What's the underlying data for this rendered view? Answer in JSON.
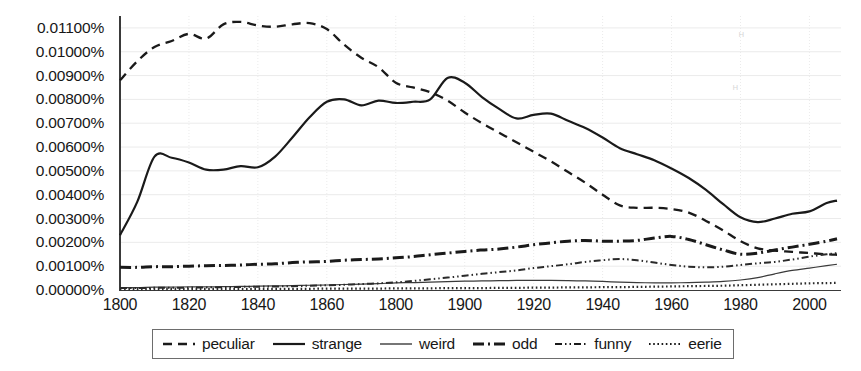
{
  "chart_data": {
    "type": "line",
    "title": "",
    "subtitle": "",
    "xlabel": "",
    "ylabel": "",
    "xlim": [
      1800,
      2008
    ],
    "ylim": [
      0.0,
      0.0115
    ],
    "grid": true,
    "legend_position": "bottom-outside",
    "y_tick_labels": [
      "0.01100%",
      "0.01000%",
      "0.00900%",
      "0.00800%",
      "0.00700%",
      "0.00600%",
      "0.00500%",
      "0.00400%",
      "0.00300%",
      "0.00200%",
      "0.00100%",
      "0.00000%"
    ],
    "y_tick_values": [
      0.011,
      0.01,
      0.009,
      0.008,
      0.007,
      0.006,
      0.005,
      0.004,
      0.003,
      0.002,
      0.001,
      0.0
    ],
    "x_tick_labels": [
      "1800",
      "1820",
      "1840",
      "1860",
      "1800",
      "1900",
      "1920",
      "1940",
      "1960",
      "1980",
      "2000"
    ],
    "x_tick_values": [
      1800,
      1820,
      1840,
      1860,
      1880,
      1900,
      1920,
      1940,
      1960,
      1980,
      2000
    ],
    "x": [
      1800,
      1805,
      1810,
      1815,
      1820,
      1825,
      1830,
      1835,
      1840,
      1845,
      1850,
      1855,
      1860,
      1865,
      1870,
      1875,
      1880,
      1885,
      1890,
      1895,
      1900,
      1905,
      1910,
      1915,
      1920,
      1925,
      1930,
      1935,
      1940,
      1945,
      1950,
      1955,
      1960,
      1965,
      1970,
      1975,
      1980,
      1985,
      1990,
      1995,
      2000,
      2005,
      2008
    ],
    "series": [
      {
        "name": "peculiar",
        "style": "dashed",
        "color": "#1a1a1a",
        "values": [
          0.0088,
          0.0096,
          0.0102,
          0.01045,
          0.01075,
          0.01055,
          0.01115,
          0.01125,
          0.0111,
          0.01105,
          0.01115,
          0.0112,
          0.01095,
          0.0103,
          0.00975,
          0.00935,
          0.0087,
          0.0085,
          0.0083,
          0.00795,
          0.00745,
          0.007,
          0.0066,
          0.0062,
          0.0058,
          0.0054,
          0.00495,
          0.0045,
          0.004,
          0.00355,
          0.00345,
          0.00345,
          0.0034,
          0.00325,
          0.0029,
          0.0025,
          0.00205,
          0.00175,
          0.00165,
          0.0016,
          0.00155,
          0.0015,
          0.00148
        ]
      },
      {
        "name": "strange",
        "style": "solid",
        "color": "#1a1a1a",
        "values": [
          0.0023,
          0.0037,
          0.0056,
          0.00555,
          0.00535,
          0.00505,
          0.00505,
          0.0052,
          0.00515,
          0.0056,
          0.0064,
          0.00725,
          0.0079,
          0.008,
          0.00775,
          0.00795,
          0.00785,
          0.0079,
          0.008,
          0.0089,
          0.0087,
          0.0081,
          0.0076,
          0.0072,
          0.00735,
          0.0074,
          0.0071,
          0.0068,
          0.0064,
          0.00595,
          0.0057,
          0.00545,
          0.0051,
          0.0047,
          0.0042,
          0.0036,
          0.00305,
          0.00285,
          0.003,
          0.0032,
          0.0033,
          0.00365,
          0.00375
        ]
      },
      {
        "name": "weird",
        "style": "thin-solid",
        "color": "#3a3a3a",
        "values": [
          0.0001,
          0.0001,
          0.00012,
          0.00012,
          0.00013,
          0.00013,
          0.00014,
          0.00015,
          0.00016,
          0.00017,
          0.00018,
          0.0002,
          0.00021,
          0.00023,
          0.00025,
          0.00027,
          0.0003,
          0.00031,
          0.00033,
          0.00035,
          0.00037,
          0.00038,
          0.00039,
          0.0004,
          0.0004,
          0.0004,
          0.00039,
          0.00038,
          0.00036,
          0.00033,
          0.00031,
          0.0003,
          0.0003,
          0.00031,
          0.00033,
          0.00036,
          0.00042,
          0.00052,
          0.00068,
          0.00082,
          0.00092,
          0.00102,
          0.00108
        ]
      },
      {
        "name": "odd",
        "style": "dash-dot",
        "color": "#1a1a1a",
        "values": [
          0.00095,
          0.00095,
          0.00098,
          0.00098,
          0.001,
          0.00102,
          0.00103,
          0.00105,
          0.00108,
          0.0011,
          0.00115,
          0.00118,
          0.0012,
          0.00125,
          0.00128,
          0.0013,
          0.00135,
          0.0014,
          0.00148,
          0.00155,
          0.00162,
          0.00168,
          0.00172,
          0.0018,
          0.0019,
          0.00198,
          0.00205,
          0.00208,
          0.00205,
          0.00205,
          0.00208,
          0.00218,
          0.00225,
          0.00212,
          0.0019,
          0.00168,
          0.0015,
          0.00155,
          0.00168,
          0.0018,
          0.00192,
          0.00205,
          0.00215
        ]
      },
      {
        "name": "funny",
        "style": "dash-dot-dot",
        "color": "#2a2a2a",
        "values": [
          8e-05,
          8e-05,
          9e-05,
          9e-05,
          0.0001,
          0.00011,
          0.00012,
          0.00013,
          0.00014,
          0.00015,
          0.00016,
          0.00018,
          0.0002,
          0.00022,
          0.00025,
          0.00028,
          0.00032,
          0.00038,
          0.00045,
          0.00052,
          0.0006,
          0.00068,
          0.00075,
          0.00082,
          0.00092,
          0.001,
          0.00108,
          0.00118,
          0.00125,
          0.0013,
          0.00125,
          0.00115,
          0.00105,
          0.00098,
          0.00095,
          0.00098,
          0.00105,
          0.00112,
          0.00118,
          0.00128,
          0.0014,
          0.0015,
          0.00155
        ]
      },
      {
        "name": "eerie",
        "style": "dotted",
        "color": "#2a2a2a",
        "values": [
          4e-05,
          4e-05,
          4e-05,
          4e-05,
          4e-05,
          4e-05,
          5e-05,
          5e-05,
          5e-05,
          5e-05,
          5e-05,
          5e-05,
          6e-05,
          6e-05,
          6e-05,
          6e-05,
          7e-05,
          7e-05,
          7e-05,
          8e-05,
          8e-05,
          8e-05,
          9e-05,
          9e-05,
          0.0001,
          0.0001,
          0.00011,
          0.00011,
          0.00012,
          0.00012,
          0.00013,
          0.00014,
          0.00015,
          0.00016,
          0.00017,
          0.00018,
          0.0002,
          0.00022,
          0.00024,
          0.00026,
          0.00028,
          0.00029,
          0.0003
        ]
      }
    ]
  },
  "legend": {
    "items": [
      {
        "label": "peculiar",
        "style": "dashed"
      },
      {
        "label": "strange",
        "style": "solid"
      },
      {
        "label": "weird",
        "style": "thin-solid"
      },
      {
        "label": "odd",
        "style": "dash-dot"
      },
      {
        "label": "funny",
        "style": "dash-dot-dot"
      },
      {
        "label": "eerie",
        "style": "dotted"
      }
    ]
  }
}
